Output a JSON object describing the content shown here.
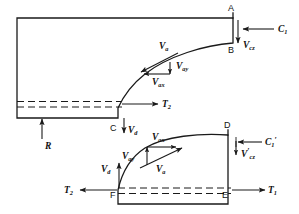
{
  "figure": {
    "type": "engineering-vector-diagram",
    "background_color": "#ffffff",
    "line_color": "#1a1a1a"
  },
  "upper_body": {
    "name": "upper-shape",
    "points": {
      "A": "A",
      "B": "B",
      "C": "C"
    },
    "vectors": {
      "Va": "V",
      "Va_sub": "a",
      "Vax": "V",
      "Vax_sub": "ax",
      "Vay": "V",
      "Vay_sub": "ay",
      "Vcz": "V",
      "Vcz_sub": "cz",
      "Vd": "V",
      "Vd_sub": "d",
      "C1": "C",
      "C1_sub": "1",
      "T2": "T",
      "T2_sub": "2",
      "R": "R"
    }
  },
  "lower_body": {
    "name": "lower-shape",
    "points": {
      "D": "D",
      "E": "E",
      "F": "F"
    },
    "vectors": {
      "Va": "V",
      "Va_sub": "a",
      "Vax": "V",
      "Vax_sub": "ax",
      "Vay": "V",
      "Vay_sub": "ay",
      "Vcz_prime": "V",
      "Vcz_prime_sub": "cz",
      "Vcz_prime_mark": "′",
      "Vd": "V",
      "Vd_sub": "d",
      "C1_prime": "C",
      "C1_prime_sub": "1",
      "C1_prime_mark": "′",
      "T1": "T",
      "T1_sub": "1",
      "T2": "T",
      "T2_sub": "2"
    }
  },
  "labels": {
    "A": "A",
    "B": "B",
    "C": "C",
    "D": "D",
    "E": "E",
    "F": "F",
    "R": "R"
  }
}
